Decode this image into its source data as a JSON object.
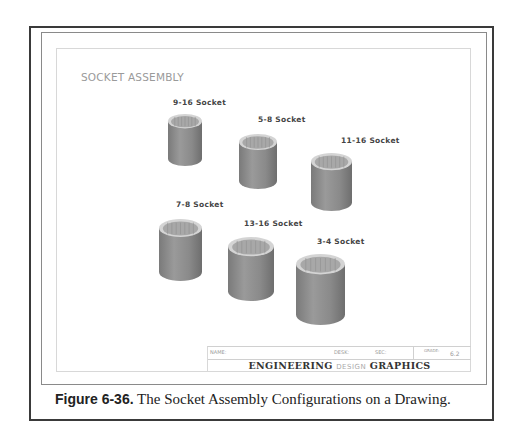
{
  "drawing": {
    "sheet_title": "SOCKET ASSEMBLY",
    "sockets": [
      {
        "label": "9-16 Socket"
      },
      {
        "label": "5-8 Socket"
      },
      {
        "label": "11-16 Socket"
      },
      {
        "label": "7-8 Socket"
      },
      {
        "label": "13-16 Socket"
      },
      {
        "label": "3-4 Socket"
      }
    ],
    "title_block": {
      "name_label": "NAME:",
      "desk_label": "DESK:",
      "sec_label": "SEC:",
      "grade_label": "GRADE:",
      "drawing_number": "6.2",
      "title_left": "ENGINEERING",
      "title_mid": "DESIGN",
      "title_right": "GRAPHICS"
    }
  },
  "caption": {
    "figure_label": "Figure 6-36.",
    "text": " The Socket Assembly Configurations on a Drawing."
  },
  "colors": {
    "socket_body": "#8c8c8c",
    "socket_rim": "#d4d4d4",
    "socket_inner": "#a8a8a8"
  }
}
